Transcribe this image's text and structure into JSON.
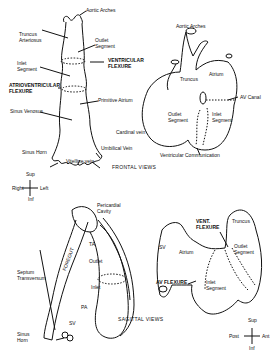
{
  "frontal": {
    "title": "FRONTAL VIEWS",
    "left": {
      "labels": {
        "aortic_arches": "Aortic Arches",
        "truncus": "Truncus\nArteriosus",
        "outlet": "Outlet\nSegment",
        "vent_flexure": "VENTRICULAR\nFLEXURE",
        "inlet": "Inlet\nSegment",
        "av_flexure": "ATRIOVENTRICULAR\nFLEXURE",
        "primitive_atrium": "Primitive Atrium",
        "sinus_venosus": "Sinus Venosus",
        "cardinal_vein": "Cardinal vein",
        "umbilical_vein": "Umbilical Vein",
        "sinus_horn": "Sinus Horn",
        "vitelline_vein": "Vitelline vein"
      },
      "orientation": {
        "sup": "Sup",
        "inf": "Inf",
        "right": "Right",
        "left": "Left"
      }
    },
    "right": {
      "labels": {
        "aortic_arches": "Aortic Arches",
        "truncus": "Truncus",
        "atrium": "Atrium",
        "av_canal": "AV Canal",
        "outlet": "Outlet\nSegment",
        "inlet": "Inlet\nSegment",
        "ventricular_communication": "Ventricular Communication"
      }
    }
  },
  "sagittal": {
    "title": "SAGITTAL VIEWS",
    "left": {
      "labels": {
        "pericardial_cavity": "Pericardial\nCavity",
        "foregut": "FOREGUT",
        "ta": "TA",
        "outlet": "Outlet",
        "inlet": "Inlet",
        "pa": "PA",
        "septum_transversum": "Septum\nTransversum",
        "sv": "SV",
        "sinus_horn": "Sinus\nHorn"
      }
    },
    "right": {
      "labels": {
        "vent_flexure": "VENT.\nFLEXURE",
        "truncus": "Truncus",
        "sv": "SV",
        "atrium": "Atrium",
        "outlet": "Outlet\nSegment",
        "av_flexure": "AV FLEXURE",
        "inlet": "Inlet\nSegment"
      },
      "orientation": {
        "sup": "Sup",
        "inf": "Inf",
        "post": "Post",
        "ant": "Ant"
      }
    }
  }
}
